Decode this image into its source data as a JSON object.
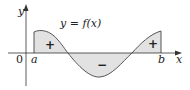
{
  "diagram": {
    "function_label": "y = f(x)",
    "axis_labels": {
      "x": "x",
      "y": "y",
      "origin": "0"
    },
    "bounds": {
      "left": "a",
      "right": "b"
    },
    "region_signs": [
      "+",
      "−",
      "+"
    ],
    "colors": {
      "fill": "#e2e2e2",
      "stroke": "#555555",
      "axis": "#333333"
    }
  }
}
